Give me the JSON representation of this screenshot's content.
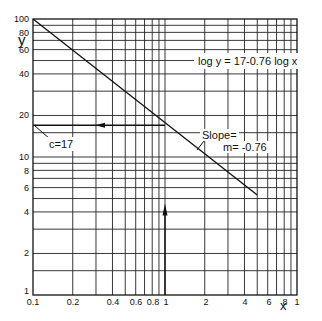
{
  "chart_data": {
    "type": "line",
    "title": "",
    "xlabel": "x",
    "ylabel": "y",
    "xscale": "log",
    "yscale": "log",
    "xlim": [
      0.1,
      10
    ],
    "ylim": [
      1,
      100
    ],
    "grid": true,
    "x_tick_labels": [
      "0.1",
      "0.2",
      "0.4",
      "0.6",
      "0.8",
      "1",
      "2",
      "4",
      "6",
      "8",
      "1"
    ],
    "y_tick_labels": [
      "100",
      "80",
      "60",
      "40",
      "20",
      "10",
      "8",
      "6",
      "4",
      "2",
      "1"
    ],
    "series": [
      {
        "name": "log y = 17 - 0.76 log x",
        "x": [
          0.1,
          1,
          5
        ],
        "y": [
          100,
          17,
          5.3
        ]
      }
    ],
    "annotations": [
      {
        "text": "log y = 17-0.76 log x",
        "type": "equation"
      },
      {
        "text": "c=17",
        "type": "intercept",
        "at": [
          0.1,
          17
        ]
      },
      {
        "text": "Slope=",
        "type": "label"
      },
      {
        "text": "m= -0.76",
        "type": "label"
      }
    ],
    "arrows": [
      {
        "from": [
          1,
          17
        ],
        "to": [
          0.1,
          17
        ],
        "direction": "left"
      },
      {
        "from": [
          1,
          1
        ],
        "to": [
          1,
          4.5
        ],
        "direction": "up"
      }
    ]
  },
  "labels": {
    "y_axis": "y",
    "x_axis": "x",
    "equation": "log y = 17-0.76 log x",
    "intercept": "c=17",
    "slope_line1": "Slope=",
    "slope_line2": "m= -0.76",
    "y_ticks": [
      {
        "v": "100",
        "y": 19
      },
      {
        "v": "80",
        "y": 33
      },
      {
        "v": "60",
        "y": 50
      },
      {
        "v": "40",
        "y": 74
      },
      {
        "v": "20",
        "y": 115
      },
      {
        "v": "10",
        "y": 157
      },
      {
        "v": "8",
        "y": 171
      },
      {
        "v": "6",
        "y": 188
      },
      {
        "v": "4",
        "y": 212
      },
      {
        "v": "2",
        "y": 253
      },
      {
        "v": "1",
        "y": 291
      }
    ],
    "x_ticks": [
      {
        "v": "0.1",
        "x": 33
      },
      {
        "v": "0.2",
        "x": 73
      },
      {
        "v": "0.4",
        "x": 113
      },
      {
        "v": "0.6",
        "x": 136
      },
      {
        "v": "0.8",
        "x": 153
      },
      {
        "v": "1",
        "x": 166
      },
      {
        "v": "2",
        "x": 206
      },
      {
        "v": "4",
        "x": 245
      },
      {
        "v": "6",
        "x": 269
      },
      {
        "v": "8",
        "x": 285
      },
      {
        "v": "1",
        "x": 297
      }
    ]
  }
}
